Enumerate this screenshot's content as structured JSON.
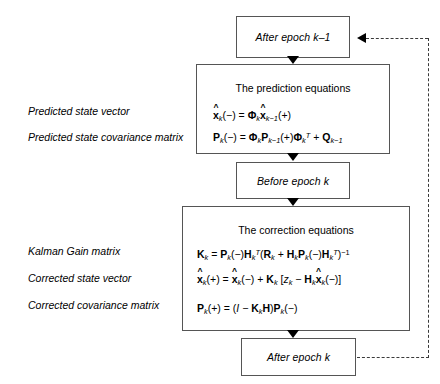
{
  "diagram": {
    "type": "flowchart",
    "nodes": {
      "after_epoch_prev": {
        "label": "After epoch k–1"
      },
      "prediction": {
        "title": "The prediction equations",
        "equations": [
          "x̂k(−) = Φk x̂k−1(+)",
          "Pk(−) = Φk Pk−1(+) ΦkT + Qk−1"
        ]
      },
      "before_epoch": {
        "label": "Before epoch k"
      },
      "correction": {
        "title": "The correction equations",
        "equations": [
          "Kk = Pk(−) HkT (Rk + Hk Pk(−) HkT)−1",
          "x̂k(+) = x̂k(−) + Kk [zk − Hk x̂k(−)]",
          "Pk(+) = (I − Kk H) Pk(−)"
        ]
      },
      "after_epoch": {
        "label": "After epoch k"
      }
    },
    "side_labels": {
      "predicted_state_vector": "Predicted state vector",
      "predicted_state_covariance": "Predicted state covariance matrix",
      "kalman_gain": "Kalman Gain matrix",
      "corrected_state_vector": "Corrected state vector",
      "corrected_covariance": "Corrected covariance matrix"
    },
    "connectors": {
      "feedback_note": "After epoch k loops back to After epoch k–1"
    },
    "colors": {
      "box_border": "#555555",
      "arrow": "#000000",
      "dashed_line": "#3a3a3a",
      "text": "#000000",
      "background": "#ffffff"
    }
  }
}
